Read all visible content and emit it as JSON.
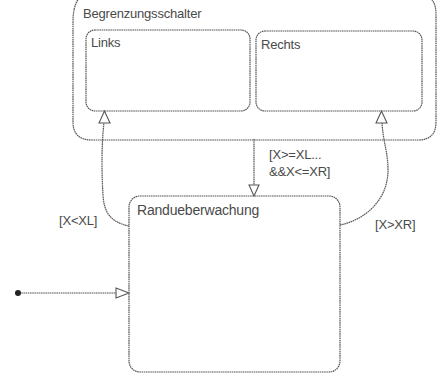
{
  "diagram": {
    "type": "stateflow-chart",
    "colors": {
      "line": "#555555",
      "text": "#4a4a4a",
      "background": "#ffffff",
      "initial_dot": "#222222"
    },
    "states": {
      "outer": {
        "name": "Begrenzungsschalter"
      },
      "left": {
        "name": "Links"
      },
      "right": {
        "name": "Rechts"
      },
      "monitor": {
        "name": "Randueberwachung"
      }
    },
    "transitions": {
      "to_left": {
        "from": "Randueberwachung",
        "to": "Links",
        "label": "[X<XL]"
      },
      "to_right": {
        "from": "Randueberwachung",
        "to": "Rechts",
        "label": "[X>XR]"
      },
      "to_monitor": {
        "from": "Begrenzungsschalter",
        "to": "Randueberwachung",
        "label_line1": "[X>=XL...",
        "label_line2": "&&X<=XR]"
      },
      "initial": {
        "to": "Randueberwachung",
        "label": ""
      }
    }
  }
}
